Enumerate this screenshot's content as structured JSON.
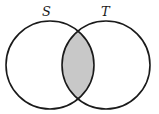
{
  "diagram": {
    "type": "venn",
    "sets": [
      {
        "label": "S",
        "cx": 50,
        "cy": 65,
        "r": 44
      },
      {
        "label": "T",
        "cx": 106,
        "cy": 65,
        "r": 44
      }
    ],
    "shaded_region": "S ∩ T",
    "colors": {
      "stroke": "#1a1a1a",
      "shade": "#c8c8c8",
      "background": "#ffffff"
    }
  }
}
